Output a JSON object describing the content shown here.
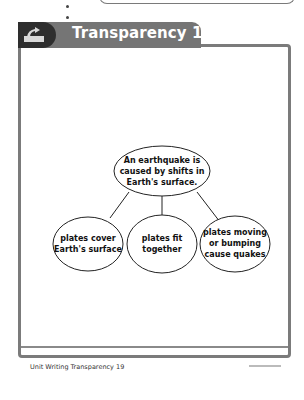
{
  "header": {
    "title": "Transparency 19",
    "icon": "overhead-projector-icon"
  },
  "diagram": {
    "main_idea": {
      "lines": [
        "An earthquake is",
        "caused by shifts in",
        "Earth's surface."
      ]
    },
    "details": [
      {
        "lines": [
          "plates cover",
          "Earth's surface"
        ]
      },
      {
        "lines": [
          "plates fit",
          "together"
        ]
      },
      {
        "lines": [
          "plates moving",
          "or bumping",
          "cause quakes"
        ]
      }
    ]
  },
  "footer": {
    "label": "Unit Writing Transparency 19",
    "copyright": "© Macmillan/McGraw-Hill"
  },
  "colors": {
    "tab": "#757575",
    "frame": "#7b7b7b",
    "icon_bg": "#2e2e2e"
  }
}
